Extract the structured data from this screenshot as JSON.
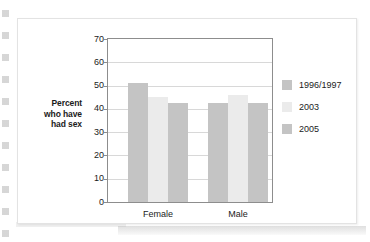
{
  "chart_data": {
    "type": "bar",
    "title": "",
    "subtitle": "",
    "xlabel": "",
    "ylabel": "Percent who have had sex",
    "ylabel_lines": [
      "Percent",
      "who have",
      "had sex"
    ],
    "categories": [
      "Female",
      "Male"
    ],
    "series": [
      {
        "name": "1996/1997",
        "values": [
          51,
          42.5
        ],
        "color": "#c4c4c4"
      },
      {
        "name": "2003",
        "values": [
          45,
          46
        ],
        "color": "#ebebeb"
      },
      {
        "name": "2005",
        "values": [
          42.5,
          42.5
        ],
        "color": "#c4c4c4"
      }
    ],
    "ylim": [
      0,
      70
    ],
    "ytick_values": [
      0,
      10,
      20,
      30,
      40,
      50,
      60,
      70
    ],
    "ytick_labels": [
      "0",
      "10",
      "20",
      "30",
      "40",
      "50",
      "60",
      "70"
    ],
    "grid": true,
    "grid_axis": "y",
    "legend_position": "right",
    "legend_entries": [
      "1996/1997",
      "2003",
      "2005"
    ]
  },
  "colors": {
    "bar_dark": "#c4c4c4",
    "bar_light": "#ebebeb",
    "axis": "#8d8d8d",
    "gridline": "#d8d8d8",
    "text": "#1b1b1b",
    "card_background": "#ffffff",
    "page_background": "#ffffff"
  }
}
